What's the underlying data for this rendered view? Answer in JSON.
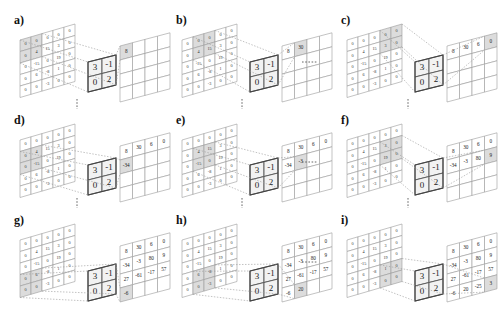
{
  "input_matrix": [
    [
      "0",
      "0",
      "0",
      "0",
      "0"
    ],
    [
      "0",
      "4",
      "15",
      "3",
      "0"
    ],
    [
      "0",
      "-15",
      "0",
      "19",
      "0"
    ],
    [
      "0",
      "6",
      "-8",
      "1",
      "0"
    ],
    [
      "0",
      "0",
      "-3",
      "0",
      "0"
    ]
  ],
  "kernel": [
    [
      "3",
      "-1"
    ],
    [
      "0",
      "2"
    ]
  ],
  "output_matrix": [
    [
      "8",
      "30",
      "6",
      "0"
    ],
    [
      "-34",
      "-3",
      "80",
      "9"
    ],
    [
      "27",
      "-61",
      "-17",
      "57"
    ],
    [
      "-6",
      "20",
      "-25",
      "3"
    ]
  ],
  "panels": [
    {
      "label": "a)",
      "row": 0,
      "col": 0,
      "step": [
        0,
        0
      ],
      "filled": 1
    },
    {
      "label": "b)",
      "row": 0,
      "col": 1,
      "step": [
        0,
        1
      ],
      "filled": 2
    },
    {
      "label": "c)",
      "row": 0,
      "col": 2,
      "step": [
        0,
        3
      ],
      "filled": 4
    },
    {
      "label": "d)",
      "row": 1,
      "col": 0,
      "step": [
        1,
        0
      ],
      "filled": 5
    },
    {
      "label": "e)",
      "row": 1,
      "col": 1,
      "step": [
        1,
        1
      ],
      "filled": 6
    },
    {
      "label": "f)",
      "row": 1,
      "col": 2,
      "step": [
        1,
        3
      ],
      "filled": 8
    },
    {
      "label": "g)",
      "row": 2,
      "col": 0,
      "step": [
        3,
        0
      ],
      "filled": 13
    },
    {
      "label": "h)",
      "row": 2,
      "col": 1,
      "step": [
        3,
        1
      ],
      "filled": 14
    },
    {
      "label": "i)",
      "row": 2,
      "col": 2,
      "step": [
        3,
        3
      ],
      "filled": 16
    }
  ],
  "separators": {
    "horizontal": "....",
    "vertical": "⋮"
  }
}
